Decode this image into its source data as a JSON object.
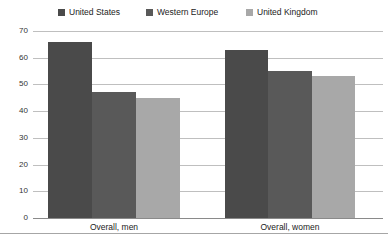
{
  "chart_data": {
    "type": "bar",
    "title": "",
    "xlabel": "",
    "ylabel": "",
    "categories": [
      "Overall, men",
      "Overall, women"
    ],
    "series": [
      {
        "name": "United States",
        "color": "#4a4a4a",
        "values": [
          66,
          63
        ]
      },
      {
        "name": "Western Europe",
        "color": "#595959",
        "values": [
          47,
          55
        ]
      },
      {
        "name": "United Kingdom",
        "color": "#a8a8a8",
        "values": [
          45,
          53
        ]
      }
    ],
    "ylim": [
      0,
      70
    ],
    "yticks": [
      0,
      10,
      20,
      30,
      40,
      50,
      60,
      70
    ],
    "grid": true,
    "legend_position": "top"
  }
}
